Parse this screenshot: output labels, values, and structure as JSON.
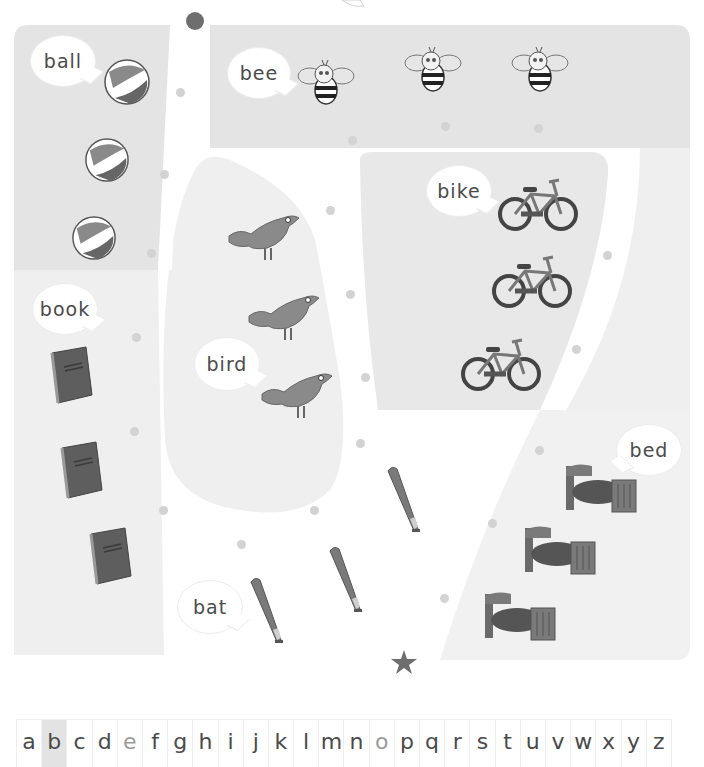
{
  "worksheet": {
    "start_marker": "circle",
    "end_marker": "star",
    "colors": {
      "region_dark": "#e4e4e4",
      "region_light": "#efefef",
      "path": "#ffffff",
      "dot": "#d3d3d3",
      "start_dot": "#6e6e6e",
      "star": "#6e6e6e",
      "object_fill": "#777777"
    },
    "groups": [
      {
        "word": "ball",
        "icon": "beach-ball-icon",
        "count": 3
      },
      {
        "word": "bee",
        "icon": "bee-icon",
        "count": 3
      },
      {
        "word": "bike",
        "icon": "bicycle-icon",
        "count": 3
      },
      {
        "word": "bird",
        "icon": "bird-icon",
        "count": 3
      },
      {
        "word": "book",
        "icon": "book-icon",
        "count": 3
      },
      {
        "word": "bed",
        "icon": "bed-icon",
        "count": 3
      },
      {
        "word": "bat",
        "icon": "baseball-bat-icon",
        "count": 3
      }
    ]
  },
  "alphabet": {
    "highlighted": "b",
    "dimmed": [
      "e",
      "o"
    ],
    "letters": [
      "a",
      "b",
      "c",
      "d",
      "e",
      "f",
      "g",
      "h",
      "i",
      "j",
      "k",
      "l",
      "m",
      "n",
      "o",
      "p",
      "q",
      "r",
      "s",
      "t",
      "u",
      "v",
      "w",
      "x",
      "y",
      "z"
    ]
  }
}
